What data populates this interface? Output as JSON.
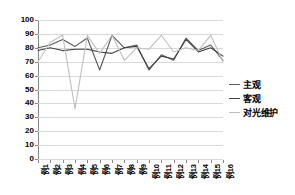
{
  "chart_data": {
    "type": "line",
    "title": "",
    "xlabel": "",
    "ylabel": "",
    "ylim": [
      0,
      100
    ],
    "ytick_step": 10,
    "yticks": [
      "0",
      "10",
      "20",
      "30",
      "40",
      "50",
      "60",
      "70",
      "80",
      "90",
      "100"
    ],
    "grid": true,
    "legend_position": "right",
    "categories": [
      "例1",
      "例2",
      "例3",
      "例4",
      "例5",
      "例6",
      "例7",
      "例8",
      "例9",
      "例10",
      "例11",
      "例12",
      "例13",
      "例14",
      "例15",
      "例16"
    ],
    "series": [
      {
        "name": "主观",
        "color": "#595959",
        "values": [
          80,
          82,
          86,
          81,
          87,
          64,
          89,
          80,
          82,
          64,
          75,
          71,
          87,
          78,
          82,
          71
        ]
      },
      {
        "name": "客观",
        "color": "#404040",
        "values": [
          78,
          80,
          78,
          79,
          79,
          77,
          76,
          80,
          81,
          65,
          74,
          72,
          86,
          77,
          80,
          74
        ]
      },
      {
        "name": "对光维护",
        "color": "#bfbfbf",
        "values": [
          70,
          84,
          89,
          36,
          89,
          76,
          89,
          71,
          80,
          79,
          89,
          77,
          80,
          78,
          89,
          70
        ]
      }
    ]
  },
  "legend": {
    "items": [
      {
        "label": "主观",
        "color": "#595959"
      },
      {
        "label": "客观",
        "color": "#404040"
      },
      {
        "label": "对光维护",
        "color": "#bfbfbf"
      }
    ]
  },
  "colors": {
    "axis": "#868686",
    "gridline": "#d9d9d9",
    "background": "#ffffff",
    "text": "#000000"
  }
}
